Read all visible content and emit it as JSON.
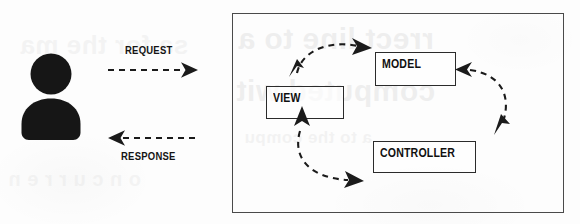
{
  "diagram": {
    "background_color": "#fdfdfd",
    "ink_color": "#141414",
    "panel_border_color": "#4a4a4a",
    "box_border_color": "#2b2b2b"
  },
  "actor": {
    "icon": "user-silhouette-icon",
    "fill_color": "#161616"
  },
  "flows": [
    {
      "id": "request",
      "label": "REQUEST",
      "direction": "right",
      "style": "dashed",
      "arrowheads": 1
    },
    {
      "id": "response",
      "label": "RESPONSE",
      "direction": "left",
      "style": "dashed",
      "arrowheads": 1
    }
  ],
  "mvc": {
    "components": [
      {
        "id": "view",
        "label": "VIEW"
      },
      {
        "id": "model",
        "label": "MODEL"
      },
      {
        "id": "controller",
        "label": "CONTROLLER"
      }
    ],
    "connections": [
      {
        "id": "view-model",
        "from": "VIEW",
        "to": "MODEL",
        "style": "dashed-curved",
        "bidirectional": true
      },
      {
        "id": "model-controller",
        "from": "MODEL",
        "to": "CONTROLLER",
        "style": "dashed-curved",
        "bidirectional": true
      },
      {
        "id": "controller-view",
        "from": "CONTROLLER",
        "to": "VIEW",
        "style": "dashed-curved",
        "bidirectional": true
      }
    ]
  },
  "scan_artifacts": {
    "ghost_text": [
      "rrect line to a",
      "computed wit",
      "a to the compu",
      "sa for the ma",
      "o n c u r r e n"
    ]
  }
}
